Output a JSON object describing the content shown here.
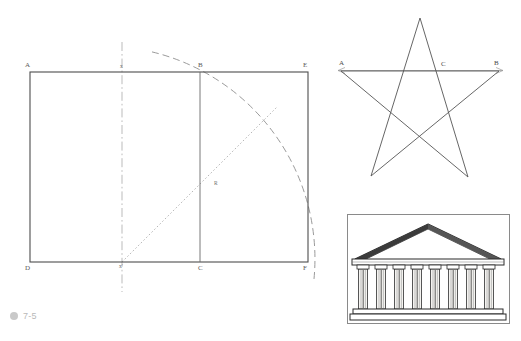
{
  "caption": {
    "marker_icon": "bullet-dot-icon",
    "number": "7-5"
  },
  "figures": {
    "golden_rectangle": {
      "name": "golden-rectangle-construction",
      "labels": {
        "A": "A",
        "B": "B",
        "C": "C",
        "D": "D",
        "E": "E",
        "F": "F",
        "R": "R",
        "x_top": "x",
        "x_bottom": "x'"
      },
      "geometry": {
        "rect_outer": {
          "x": 30,
          "y": 72,
          "w": 278,
          "h": 190
        },
        "square_right_edge_x": 200,
        "axis_x": 122,
        "axis_top_y": 42,
        "axis_bottom_y": 292,
        "arc_center": {
          "x": 122,
          "y": 262
        },
        "arc_radius": 213,
        "radius_line": {
          "x1": 122,
          "y1": 262,
          "x2": 273,
          "y2": 112
        }
      },
      "styles": {
        "solid_stroke": "#4d4d4d",
        "dash_stroke": "#8c8c8c",
        "dot_stroke": "#9a9a9a",
        "axis_stroke": "#a9a9a9"
      }
    },
    "pentagram": {
      "name": "pentagram-star-diagram",
      "labels": {
        "A": "A",
        "B": "B",
        "C": "C"
      },
      "geometry": {
        "apex": {
          "x": 420,
          "y": 18
        },
        "left_point": {
          "x": 341,
          "y": 71
        },
        "right_point": {
          "x": 499,
          "y": 71
        },
        "lower_left_point": {
          "x": 371,
          "y": 176
        },
        "lower_right_point": {
          "x": 468,
          "y": 177
        },
        "baseline": {
          "x1": 338,
          "y1": 70,
          "x2": 502,
          "y2": 70
        },
        "label_C_x": 442
      },
      "styles": {
        "stroke": "#555555",
        "baseline_stroke": "#9b9b9b"
      }
    },
    "temple": {
      "name": "greek-temple-illustration",
      "description_icon": "greek-temple-icon",
      "geometry": {
        "frame": {
          "x": 347,
          "y": 214,
          "w": 163,
          "h": 110
        },
        "column_count": 8
      },
      "styles": {
        "frame_stroke": "#8a8a8a",
        "ink": "#2b2b2b",
        "stone": "#f2f1ee"
      }
    }
  }
}
